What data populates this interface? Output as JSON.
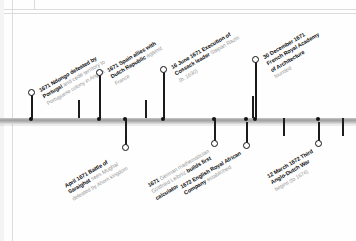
{
  "meta": {
    "axis_color": "#9e9e9e",
    "label_color": "#555555",
    "accent_color": "#0d0d0d",
    "muted_color": "#9a9a9a"
  },
  "timeline": {
    "orientation": "horizontal",
    "events": [
      {
        "id": "ndongo",
        "position": "above",
        "marker": "ring",
        "x": 31,
        "line1_bold": "1671 Ndongo defeated by",
        "line2_bold": "Portugal",
        "line2_rest": " and cede territory to",
        "line3": "Portuguese colony in Angola"
      },
      {
        "id": "spain-dutch",
        "position": "above",
        "marker": "ring",
        "x": 99,
        "line1_bold": "1671 Spain allies with",
        "line2_bold": "Dutch Republic",
        "line2_rest": " against",
        "line3": "France"
      },
      {
        "id": "razin",
        "position": "above",
        "marker": "ring",
        "x": 163,
        "line1_bold": "16 June 1671 Execution of",
        "line2_bold": "Cossack leader",
        "line2_rest": " Stepan Razin",
        "line3": "(b. 1630)"
      },
      {
        "id": "french-academy",
        "position": "above",
        "marker": "ring",
        "x": 255,
        "line1_bold": "30 December 1671",
        "line2_bold": "French Royal Academy",
        "line2b_bold": "of Architecture",
        "line3": "founded"
      },
      {
        "id": "saraighat",
        "position": "below",
        "marker": "ring",
        "x": 109,
        "line1_bold": "April 1671 Battle of",
        "line2_bold": "Saraighat",
        "line2_rest": " sees Mughal",
        "line3": "defeated by Ahom kingdom"
      },
      {
        "id": "leibniz",
        "position": "below",
        "marker": "ring",
        "x": 190,
        "line1_bold": "1671",
        "line1_rest": " German mathematician",
        "line2": "Gottfried Leibniz",
        "line2_bold": "builds first",
        "line3_bold": "calculator"
      },
      {
        "id": "royal-african",
        "position": "below",
        "marker": "ring",
        "x": 246,
        "line1_bold": "1672 English Royal African",
        "line2_bold": "Company",
        "line2_rest": " established"
      },
      {
        "id": "anglo-dutch",
        "position": "below",
        "marker": "ring",
        "x": 318,
        "line1_bold": "12 March 1672 Third",
        "line2_bold": "Anglo-Dutch War",
        "line3": "begins (to 1674)"
      }
    ],
    "ticks": [
      {
        "id": "tick-1",
        "x": 31,
        "dir": "up"
      },
      {
        "id": "tick-2",
        "x": 99,
        "dir": "up"
      },
      {
        "id": "tick-3",
        "x": 125,
        "dir": "down"
      },
      {
        "id": "tick-4",
        "x": 163,
        "dir": "up"
      },
      {
        "id": "tick-5",
        "x": 214,
        "dir": "down"
      },
      {
        "id": "tick-6",
        "x": 252,
        "dir": "up"
      },
      {
        "id": "tick-7",
        "x": 283,
        "dir": "down"
      },
      {
        "id": "tick-8",
        "x": 342,
        "dir": "down"
      }
    ]
  }
}
